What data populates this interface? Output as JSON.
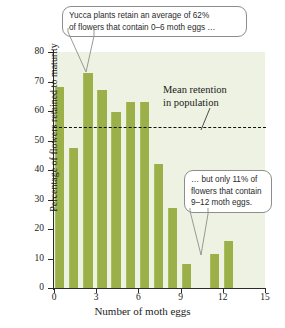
{
  "chart_data": {
    "type": "bar",
    "title": "",
    "xlabel": "Number of moth eggs",
    "ylabel": "Percentage of flowers retained to maturity",
    "categories": [
      0,
      1,
      2,
      3,
      4,
      5,
      6,
      7,
      8,
      9,
      10,
      11,
      12
    ],
    "values": [
      68,
      47.5,
      73,
      67,
      59.5,
      63,
      63,
      42,
      27,
      8,
      0,
      11.5,
      16
    ],
    "xlim": [
      0,
      15
    ],
    "ylim": [
      0,
      80
    ],
    "x_ticks": [
      0,
      3,
      6,
      9,
      12,
      15
    ],
    "y_ticks": [
      0,
      10,
      20,
      30,
      40,
      50,
      60,
      70,
      80
    ],
    "grid": false,
    "legend": "none",
    "bar_color": "#9cb04a",
    "plot_background": "#eef2e2",
    "reference_line": {
      "value": 54.5,
      "style": "dashed",
      "color": "#111111",
      "label_line_1": "Mean retention",
      "label_line_2": "in population"
    },
    "annotations": [
      {
        "id": "callout-top",
        "line_1": "Yucca plants retain an average of 62%",
        "line_2": "of flowers that contain 0–6 moth eggs …",
        "points_to_category": 2
      },
      {
        "id": "callout-bottom",
        "line_1": "… but only 11% of",
        "line_2": "flowers that contain",
        "line_3": "9–12 moth eggs.",
        "points_to_category": 11
      }
    ]
  }
}
